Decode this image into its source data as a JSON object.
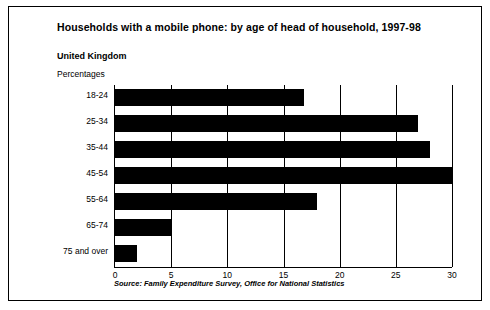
{
  "figure": {
    "title": "Households with a mobile phone: by age of head of household, 1997-98",
    "subtitle": "United Kingdom",
    "unit_label": "Percentages",
    "source": "Source: Family Expenditure Survey, Office for National Statistics"
  },
  "chart_data": {
    "type": "bar",
    "orientation": "horizontal",
    "title": "Households with a mobile phone: by age of head of household, 1997-98",
    "subtitle": "United Kingdom",
    "xlabel": "Percentages",
    "ylabel": "",
    "categories": [
      "18-24",
      "25-34",
      "35-44",
      "45-54",
      "55-64",
      "65-74",
      "75 and over"
    ],
    "values": [
      16.8,
      27.0,
      28.0,
      30.0,
      18.0,
      5.0,
      2.0
    ],
    "xlim": [
      0,
      30
    ],
    "xticks": [
      0,
      5,
      10,
      15,
      20,
      25,
      30
    ],
    "xtick_labels": [
      "0",
      "5",
      "10",
      "15",
      "20",
      "25",
      "30"
    ],
    "grid": "vertical",
    "legend": "none",
    "bar_color": "#000000"
  }
}
